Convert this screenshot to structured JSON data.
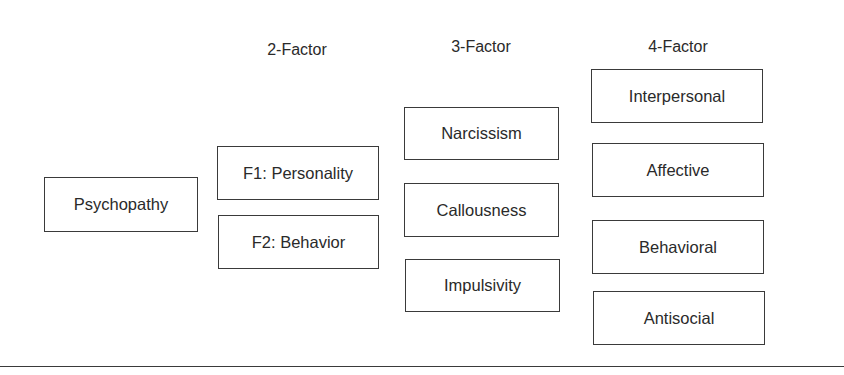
{
  "diagram": {
    "root": {
      "label": "Psychopathy"
    },
    "columns": [
      {
        "header": "2-Factor",
        "factors": [
          "F1: Personality",
          "F2: Behavior"
        ]
      },
      {
        "header": "3-Factor",
        "factors": [
          "Narcissism",
          "Callousness",
          "Impulsivity"
        ]
      },
      {
        "header": "4-Factor",
        "factors": [
          "Interpersonal",
          "Affective",
          "Behavioral",
          "Antisocial"
        ]
      }
    ]
  }
}
